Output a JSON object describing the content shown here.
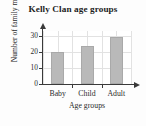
{
  "chart_data": {
    "type": "bar",
    "title": "Kelly Clan age groups",
    "xlabel": "Age groups",
    "ylabel": "Number of family members",
    "categories": [
      "Baby",
      "Child",
      "Adult"
    ],
    "values": [
      20,
      24,
      29
    ],
    "ylim": [
      0,
      33
    ],
    "yticks": [
      0,
      10,
      20,
      30
    ],
    "ytick_labels": [
      "0",
      "10",
      "20",
      "30"
    ],
    "grid": true,
    "legend": null,
    "bar_color": "#b9b9b9",
    "axis_color": "#3a3a3a",
    "grid_color": "#e2e2e2",
    "background": "#ffffff"
  }
}
